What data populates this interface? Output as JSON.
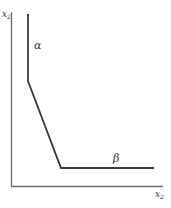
{
  "diagram": {
    "type": "isoquant-kinked",
    "axes": {
      "y_label": "x",
      "y_label_sub": "2",
      "x_label": "x",
      "x_label_sub": "2"
    },
    "segments": {
      "alpha_label": "α",
      "beta_label": "β"
    },
    "colors": {
      "axis": "#6b6b6b",
      "curve": "#3a3a3a",
      "text": "#333333"
    }
  }
}
